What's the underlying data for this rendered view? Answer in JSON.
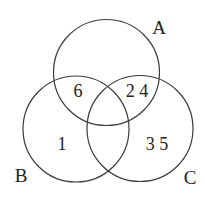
{
  "diagram": {
    "type": "venn",
    "sets": [
      {
        "name": "A",
        "cx": 106.5,
        "cy": 72.5,
        "r": 53,
        "label_x": 159,
        "label_y": 34
      },
      {
        "name": "B",
        "cx": 76,
        "cy": 129,
        "r": 53,
        "label_x": 21,
        "label_y": 182
      },
      {
        "name": "C",
        "cx": 140,
        "cy": 128.5,
        "r": 53,
        "label_x": 190,
        "label_y": 184
      }
    ],
    "regions": [
      {
        "label": "6",
        "sets": [
          "A",
          "B"
        ],
        "x": 78,
        "y": 97
      },
      {
        "label": "2 4",
        "sets": [
          "A",
          "C"
        ],
        "x": 137,
        "y": 97
      },
      {
        "label": "1",
        "sets": [
          "B"
        ],
        "x": 62,
        "y": 150
      },
      {
        "label": "3 5",
        "sets": [
          "C"
        ],
        "x": 157,
        "y": 150
      }
    ],
    "stroke_color": "#3a3a3a",
    "text_color": "#222222"
  }
}
